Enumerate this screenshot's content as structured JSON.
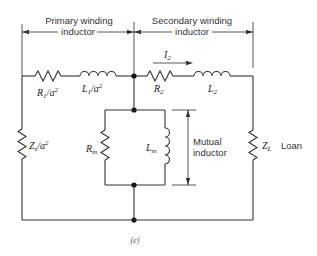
{
  "diagram": {
    "type": "transformer equivalent circuit",
    "caption": "(e)",
    "sections": {
      "primary": {
        "label_line1": "Primary winding",
        "label_line2": "inductor"
      },
      "secondary": {
        "label_line1": "Secondary winding",
        "label_line2": "inductor"
      }
    },
    "components": {
      "r1": {
        "symbol": "R",
        "sub": "1",
        "suffix": "/a",
        "sup": "2"
      },
      "l1": {
        "symbol": "L",
        "sub": "1",
        "suffix": "/a",
        "sup": "2"
      },
      "r2": {
        "symbol": "R",
        "sub": "2"
      },
      "l2": {
        "symbol": "L",
        "sub": "2"
      },
      "zs": {
        "symbol": "Z",
        "sub": "s",
        "suffix": "/a",
        "sup": "2"
      },
      "rm": {
        "symbol": "R",
        "sub": "m"
      },
      "lm": {
        "symbol": "L",
        "sub": "m"
      },
      "zl": {
        "symbol": "Z",
        "sub": "L",
        "note": "Loan"
      }
    },
    "current": {
      "symbol": "I",
      "sub": "2"
    },
    "mutual": {
      "line1": "Mutual",
      "line2": "inductor"
    }
  }
}
